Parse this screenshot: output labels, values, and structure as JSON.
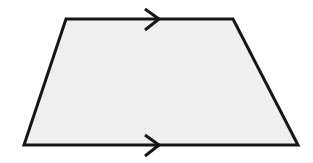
{
  "figure": {
    "name": "trapezoid-with-parallel-marks",
    "shape_type": "trapezoid",
    "caption": "",
    "canvas": {
      "width": 313,
      "height": 163,
      "background_color": "#ffffff"
    },
    "polygon": {
      "name": "trapezoid",
      "fill_color": "#f0f0f0",
      "stroke_color": "#161616",
      "stroke_width": 3,
      "points": "66,19 233,19 298,145 24,145",
      "vertices": [
        {
          "label": "top-left",
          "x": 66,
          "y": 19
        },
        {
          "label": "top-right",
          "x": 233,
          "y": 19
        },
        {
          "label": "bottom-right",
          "x": 298,
          "y": 145
        },
        {
          "label": "bottom-left",
          "x": 24,
          "y": 145
        }
      ]
    },
    "edges": [
      {
        "name": "top-edge",
        "from": "top-left",
        "to": "top-right",
        "marks": 1,
        "parallel_group": "A"
      },
      {
        "name": "right-edge",
        "from": "top-right",
        "to": "bottom-right",
        "marks": 0,
        "parallel_group": ""
      },
      {
        "name": "bottom-edge",
        "from": "bottom-right",
        "to": "bottom-left",
        "marks": 1,
        "parallel_group": "A"
      },
      {
        "name": "left-edge",
        "from": "bottom-left",
        "to": "top-left",
        "marks": 0,
        "parallel_group": ""
      }
    ],
    "markers": [
      {
        "name": "top-parallel-arrow",
        "glyph": "chevron-right",
        "direction": "right",
        "on_edge": "top-edge",
        "center_x": 151,
        "center_y": 19,
        "path": "145,9 159,19 145,30",
        "stroke_color": "#161616",
        "stroke_width": 3
      },
      {
        "name": "bottom-parallel-arrow",
        "glyph": "chevron-right",
        "direction": "right",
        "on_edge": "bottom-edge",
        "center_x": 151,
        "center_y": 145,
        "path": "145,135 159,145 145,156",
        "stroke_color": "#161616",
        "stroke_width": 3
      }
    ],
    "texture": {
      "name": "scan-grid-texture",
      "line_color": "#e4e4e4",
      "spacing": 4,
      "opacity": 0.55
    }
  }
}
